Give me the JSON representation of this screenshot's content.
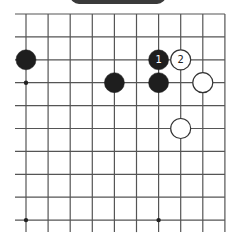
{
  "banner": {
    "title": ""
  },
  "board": {
    "cols": 10,
    "rows": 10,
    "x0": 26,
    "dx": 22.1,
    "y0": 14,
    "dy": 22.9,
    "line_left_extend": 11,
    "line_bottom_extend": 12,
    "line_color": "#555555",
    "star_points": [
      [
        0,
        3
      ],
      [
        0,
        9
      ],
      [
        6,
        9
      ]
    ],
    "stones": [
      {
        "color": "black",
        "col": 0,
        "row": 2,
        "label": ""
      },
      {
        "color": "black",
        "col": 4,
        "row": 3,
        "label": ""
      },
      {
        "color": "black",
        "col": 6,
        "row": 2,
        "label": "1"
      },
      {
        "color": "white",
        "col": 7,
        "row": 2,
        "label": "2"
      },
      {
        "color": "black",
        "col": 6,
        "row": 3,
        "label": ""
      },
      {
        "color": "white",
        "col": 8,
        "row": 3,
        "label": ""
      },
      {
        "color": "white",
        "col": 7,
        "row": 5,
        "label": ""
      }
    ],
    "black_color": "#1e1e1e",
    "white_color": "#ffffff"
  },
  "caption": {
    "text": ""
  }
}
